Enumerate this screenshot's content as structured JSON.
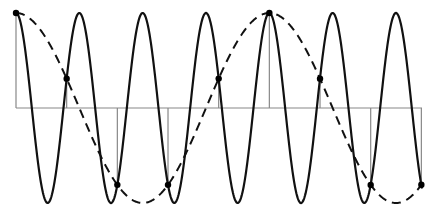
{
  "diagram": {
    "type": "aliasing-illustration",
    "colors": {
      "signal": "#111111",
      "alias": "#111111",
      "axis": "#888888",
      "stems": "#888888",
      "samples": "#000000",
      "background": "#ffffff"
    },
    "geometry": {
      "x_start": 16,
      "x_end": 422,
      "axis_y": 108,
      "amplitude": 95,
      "signal_period_px": 63.33,
      "alias_period_px": 253.33,
      "sample_spacing_px": 50.67,
      "sample_count": 9
    },
    "signal": {
      "name": "original-signal",
      "style": "solid",
      "cycles_shown": 6.4
    },
    "alias": {
      "name": "aliased-signal",
      "style": "dashed",
      "cycles_shown": 1.6
    },
    "samples": [
      {
        "x": 16,
        "y": 13
      },
      {
        "x": 66.7,
        "y": 79
      },
      {
        "x": 117.3,
        "y": 185
      },
      {
        "x": 168,
        "y": 185
      },
      {
        "x": 218.7,
        "y": 79
      },
      {
        "x": 269.3,
        "y": 13
      },
      {
        "x": 320,
        "y": 79
      },
      {
        "x": 370.7,
        "y": 185
      },
      {
        "x": 421.3,
        "y": 185
      }
    ]
  }
}
